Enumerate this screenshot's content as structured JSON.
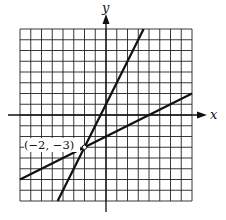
{
  "chart_data": {
    "type": "line",
    "title": "",
    "xlabel": "x",
    "ylabel": "y",
    "xlim": [
      -8,
      8
    ],
    "ylim": [
      -8,
      8
    ],
    "grid": true,
    "series": [
      {
        "name": "line-1",
        "equation": "y = 2x + 1",
        "slope": 2,
        "intercept": 1,
        "x": [
          -4.5,
          3.5
        ],
        "y": [
          -8,
          8
        ]
      },
      {
        "name": "line-2",
        "equation": "y = 0.5x - 2",
        "slope": 0.5,
        "intercept": -2,
        "x": [
          -8,
          8
        ],
        "y": [
          -6,
          2
        ]
      }
    ],
    "annotations": [
      {
        "text": "(−2, −3)",
        "x": -2,
        "y": -3
      }
    ]
  },
  "labels": {
    "x_axis": "x",
    "y_axis": "y",
    "point": "(−2, −3)"
  },
  "colors": {
    "grid": "#222222",
    "line": "#111111",
    "background": "#ffffff"
  }
}
